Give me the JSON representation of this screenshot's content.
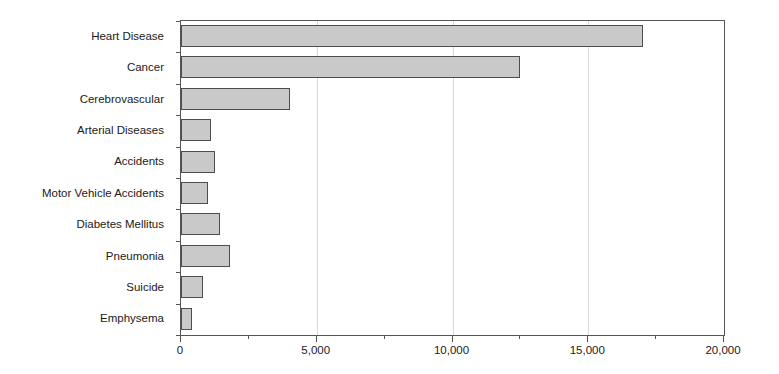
{
  "chart_data": {
    "type": "bar",
    "orientation": "horizontal",
    "title": "",
    "xlabel": "",
    "ylabel": "",
    "xlim": [
      0,
      20000
    ],
    "ylim": null,
    "grid": true,
    "grid_axis": "x",
    "legend": false,
    "bar_color": "#c9c9c9",
    "bar_border_color": "#4d4d4d",
    "axis_color": "#555555",
    "gridline_color": "#d8d8d8",
    "categories": [
      "Heart Disease",
      "Cancer",
      "Cerebrovascular",
      "Arterial Diseases",
      "Accidents",
      "Motor Vehicle Accidents",
      "Diabetes Mellitus",
      "Pneumonia",
      "Suicide",
      "Emphysema"
    ],
    "values": [
      17000,
      12500,
      4000,
      1100,
      1250,
      1000,
      1450,
      1800,
      800,
      420
    ],
    "xticks": [
      0,
      5000,
      10000,
      15000,
      20000
    ],
    "xticklabels": [
      "0",
      "5,000",
      "10,000",
      "15,000",
      "20,000"
    ],
    "xminorticks": [
      2500,
      7500,
      12500,
      17500
    ]
  }
}
